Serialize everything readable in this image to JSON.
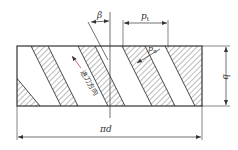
{
  "diagram": {
    "labels": {
      "beta": "β",
      "pitch_transverse": "p",
      "pitch_transverse_sub": "t",
      "pitch_normal": "p",
      "pitch_normal_sub": "n",
      "width": "b",
      "circumference": "πd",
      "feed_direction": "进刀方向"
    },
    "colors": {
      "line": "#333333",
      "hatch": "#555555",
      "feed_arrow": "#d0607a",
      "background": "#ffffff"
    },
    "rect": {
      "x": 17,
      "y": 46,
      "w": 185,
      "h": 60
    },
    "bands_top": [
      [
        31,
        48
      ],
      [
        78,
        95
      ],
      [
        122,
        145
      ],
      [
        165,
        200
      ]
    ]
  }
}
